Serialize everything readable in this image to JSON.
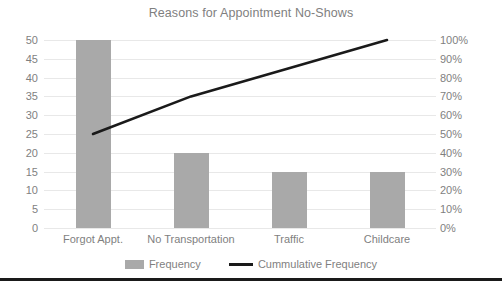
{
  "chart_data": {
    "type": "bar",
    "title": "Reasons for Appointment No-Shows",
    "xlabel": "",
    "ylabel": "",
    "categories": [
      "Forgot Appt.",
      "No Transportation",
      "Traffic",
      "Childcare"
    ],
    "series": [
      {
        "name": "Frequency",
        "type": "bar",
        "axis": "left",
        "color": "#a9a9a9",
        "values": [
          50,
          20,
          15,
          15
        ]
      },
      {
        "name": "Cummulative Frequency",
        "type": "line",
        "axis": "right",
        "color": "#1a1a1a",
        "values": [
          50,
          70,
          85,
          100
        ]
      }
    ],
    "ylim": [
      0,
      50
    ],
    "y_ticks": [
      "50",
      "45",
      "40",
      "35",
      "30",
      "25",
      "20",
      "15",
      "10",
      "5",
      "0"
    ],
    "y2lim": [
      0,
      100
    ],
    "y2_ticks": [
      "100%",
      "90%",
      "80%",
      "70%",
      "60%",
      "50%",
      "40%",
      "30%",
      "20%",
      "10%",
      "0%"
    ],
    "grid": true,
    "legend_position": "bottom"
  },
  "legend": {
    "frequency_label": "Frequency",
    "cumulative_label": "Cummulative Frequency"
  },
  "colors": {
    "bar": "#a9a9a9",
    "line": "#1a1a1a",
    "text": "#7f7f7f",
    "gridline": "#e8e8e8",
    "border": "#1a1a1a",
    "background": "#ffffff"
  }
}
